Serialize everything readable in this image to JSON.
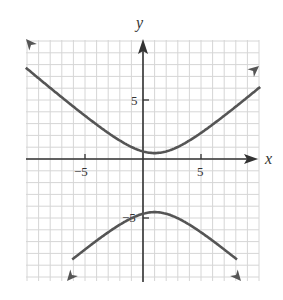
{
  "chart_data": {
    "type": "line",
    "title": "",
    "xlabel": "x",
    "ylabel": "y",
    "xlim": [
      -10,
      10
    ],
    "ylim": [
      -10,
      10
    ],
    "grid": true,
    "grid_step": 1,
    "x_tick_labels": [
      {
        "value": -5,
        "label": "−5"
      },
      {
        "value": 5,
        "label": "5"
      }
    ],
    "y_tick_labels": [
      {
        "value": 5,
        "label": "5"
      },
      {
        "value": -5,
        "label": "−5"
      }
    ],
    "curve": "hyperbola (vertical transverse axis)",
    "center": [
      1,
      -2
    ],
    "series": [
      {
        "name": "upper branch",
        "x": [
          -10,
          -8,
          -6,
          -4,
          -2,
          0,
          1,
          2,
          4,
          6,
          8,
          10
        ],
        "y": [
          9.5,
          7.2,
          5.0,
          3.1,
          1.6,
          0.7,
          0.5,
          0.7,
          1.6,
          3.1,
          5.0,
          7.2
        ]
      },
      {
        "name": "lower branch",
        "x": [
          -6,
          -4,
          -2,
          0,
          1,
          2,
          4,
          6,
          8
        ],
        "y": [
          -9.9,
          -8.1,
          -6.6,
          -4.7,
          -4.5,
          -4.7,
          -5.6,
          -7.1,
          -9.9
        ]
      }
    ],
    "colors": {
      "curve": "#555555",
      "axis": "#333333",
      "grid": "#d6d6d6"
    }
  },
  "labels": {
    "x_axis": "x",
    "y_axis": "y",
    "x_neg5": "−5",
    "x_pos5": "5",
    "y_pos5": "5",
    "y_neg5": "−5"
  }
}
